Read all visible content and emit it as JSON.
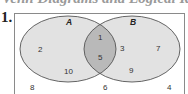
{
  "heading": "Venn Diagrams and Logical Reasoning",
  "problem_number": "1.",
  "sets": [
    {
      "name": "A",
      "color": "#e2e2e2"
    },
    {
      "name": "B",
      "color": "#e2e2e2"
    }
  ],
  "intersection_color": "#b9b9b9",
  "outline_color": "#555555",
  "regions": {
    "A_only": [
      "2",
      "10"
    ],
    "A_and_B": [
      "1",
      "5"
    ],
    "B_only": [
      "3",
      "7",
      "9"
    ],
    "outside": [
      "8",
      "6",
      "4"
    ]
  },
  "labels": {
    "set_a": "A",
    "set_b": "B",
    "a_only_1": "2",
    "a_only_2": "10",
    "both_1": "1",
    "both_2": "5",
    "b_only_1": "3",
    "b_only_2": "7",
    "b_only_3": "9",
    "outside_1": "8",
    "outside_2": "6",
    "outside_3": "4"
  }
}
